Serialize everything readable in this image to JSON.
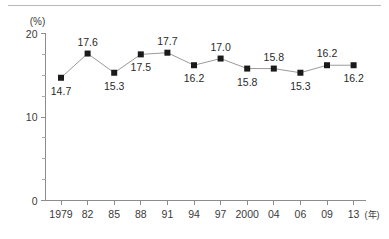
{
  "chart_data": {
    "type": "line",
    "title": "",
    "xlabel": "年",
    "ylabel": "%",
    "yunit_label": "(%)",
    "xaxis_suffix": "(年)",
    "ylim": [
      0,
      20
    ],
    "y_ticks_major": [
      0,
      10,
      20
    ],
    "y_ticks_major_labels": [
      "0",
      "10",
      "20"
    ],
    "y_ticks_minor": [
      2.5,
      5,
      7.5,
      12.5,
      15,
      17.5
    ],
    "grid": false,
    "legend": "none",
    "categories": [
      "1979",
      "82",
      "85",
      "88",
      "91",
      "94",
      "97",
      "2000",
      "04",
      "06",
      "09",
      "13"
    ],
    "values": [
      14.7,
      17.6,
      15.3,
      17.5,
      17.7,
      16.2,
      17.0,
      15.8,
      15.8,
      15.3,
      16.2,
      16.2
    ],
    "point_labels": [
      "14.7",
      "17.6",
      "15.3",
      "17.5",
      "17.7",
      "16.2",
      "17.0",
      "15.8",
      "15.8",
      "15.3",
      "16.2",
      "16.2"
    ],
    "label_positions": [
      "below",
      "above",
      "below",
      "below",
      "above",
      "below",
      "above",
      "below",
      "above",
      "below",
      "above",
      "below"
    ],
    "marker": "square",
    "colors": {
      "marker": "#1a1a1a",
      "line": "#9a9a9a",
      "axis": "#8c8c8c",
      "text": "#2a2a2a",
      "background": "#ffffff",
      "top_rule": "#b9b9b9"
    }
  }
}
